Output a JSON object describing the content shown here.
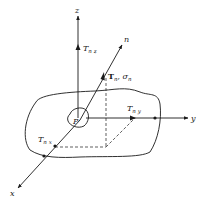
{
  "diagram": {
    "type": "3d-coordinate-stress-vector",
    "labels": {
      "z_axis": "z",
      "y_axis": "y",
      "x_axis": "x",
      "normal_axis": "n",
      "point": "P",
      "T_nz": {
        "main": "T",
        "sub": "n z"
      },
      "T_ny": {
        "main": "T",
        "sub": "n y"
      },
      "T_nx": {
        "main": "T",
        "sub": "n x"
      },
      "T_n_sigma_n": {
        "t": "T",
        "t_sub": "n",
        "sep": ", ",
        "s": "σ",
        "s_sub": "n"
      }
    },
    "colors": {
      "line": "#1a1a1a",
      "background": "#ffffff"
    }
  }
}
